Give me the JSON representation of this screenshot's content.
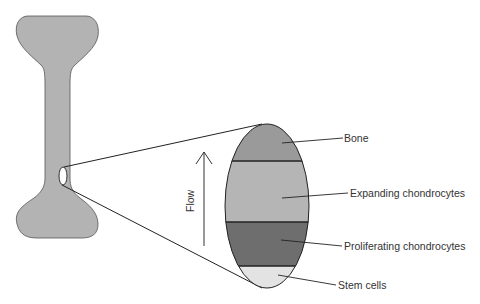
{
  "diagram": {
    "flow_label": "Flow",
    "labels": {
      "bone": "Bone",
      "expanding": "Expanding chondrocytes",
      "proliferating": "Proliferating chondrocytes",
      "stem": "Stem cells"
    },
    "colors": {
      "bone_shape": "#b3b3b3",
      "band_bone": "#9a9a9a",
      "band_expanding": "#b5b5b5",
      "band_proliferating": "#6e6e6e",
      "band_stem": "#e3e3e3",
      "outline": "#333333"
    }
  }
}
